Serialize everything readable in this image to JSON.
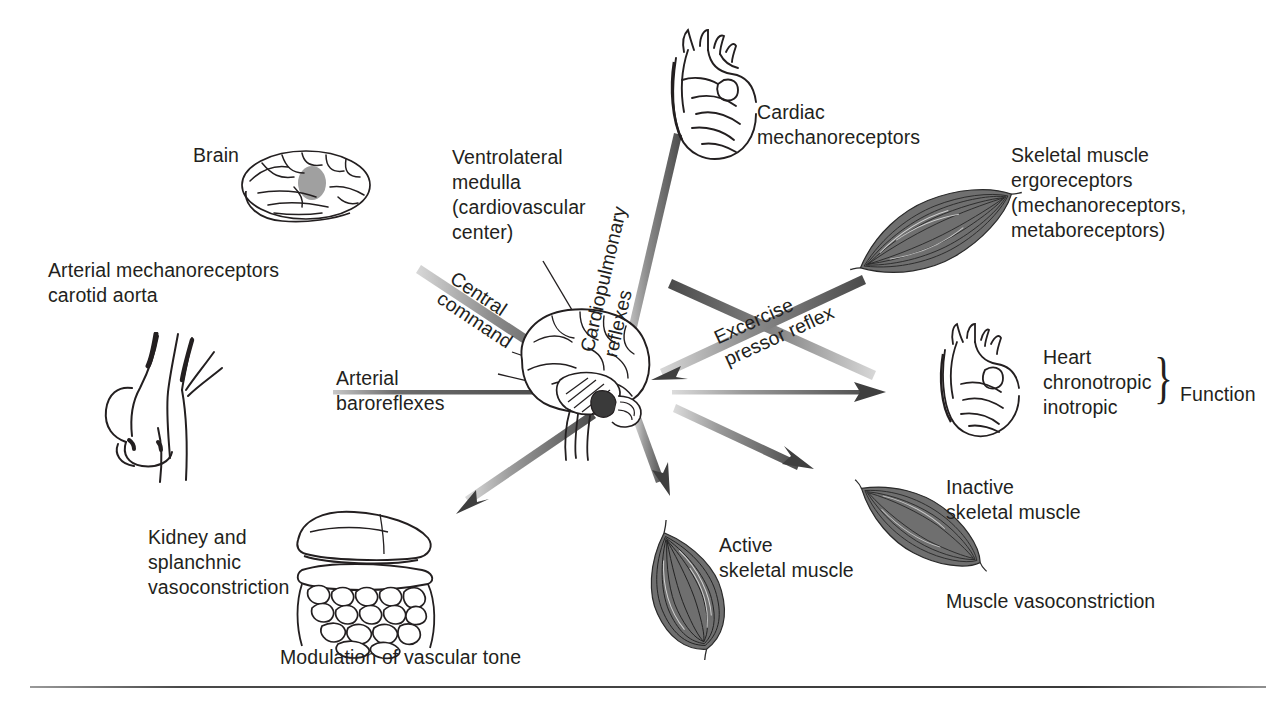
{
  "figure": {
    "background_color": "#ffffff",
    "ink_color": "#231f20",
    "arrow_color_dark": "#4d4d4d",
    "arrow_color_light": "#d0d0d0",
    "width": 1270,
    "height": 704
  },
  "labels": {
    "brain": "Brain",
    "arterial_mechanoreceptors": "Arterial mechanoreceptors\ncarotid aorta",
    "ventrolateral_medulla": "Ventrolateral\nmedulla\n(cardiovascular\ncenter)",
    "cardiac_mechanoreceptors": "Cardiac\nmechanoreceptors",
    "skeletal_muscle_ergoreceptors": "Skeletal muscle\nergoreceptors\n(mechanoreceptors,\nmetaboreceptors)",
    "heart_function": "Heart\nchronotropic\ninotropic",
    "function": "Function",
    "inactive_skeletal_muscle": "Inactive\nskeletal muscle",
    "muscle_vasoconstriction": "Muscle vasoconstriction",
    "active_skeletal_muscle": "Active\nskeletal muscle",
    "modulation_of_vascular_tone": "Modulation of vascular tone",
    "kidney_splanchnic": "Kidney and\nsplanchnic\nvasoconstriction",
    "brace_glyph": "}"
  },
  "arrow_labels": {
    "central_command": "Central\ncommand",
    "cardiopulmonary_reflexes": "Cardiopulmonary\nreflexes",
    "excercise_pressor_reflex": "Excercise\npressor reflex",
    "arterial_baroreflexes": "Arterial\nbaroreflexes"
  },
  "illustrations": {
    "brain_lateral": "brain-lateral-illustration",
    "aortic_arch": "aortic-arch-illustration",
    "heart_top": "heart-illustration",
    "heart_right": "heart-illustration",
    "brainstem_center": "brain-brainstem-illustration",
    "muscle_ergoreceptor": "skeletal-muscle-illustration",
    "muscle_inactive": "skeletal-muscle-illustration",
    "muscle_active": "skeletal-muscle-illustration",
    "viscera": "kidney-splanchnic-viscera-illustration"
  }
}
